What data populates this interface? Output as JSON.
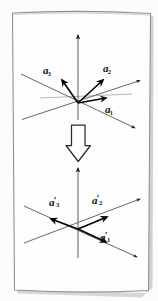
{
  "figure": {
    "kind": "scanned-book-figure",
    "caption_text": "",
    "background_color": "#fdfdfc",
    "ink_color": "#111111",
    "page_border_color": "#8a8a8a",
    "shadow_color": "#b9b9b9"
  },
  "panels": [
    {
      "id": "upper-axes-diagram",
      "name": "original-axes",
      "origin": {
        "x": 78,
        "y": 103
      },
      "vectors": [
        {
          "id": "a1",
          "label_a": "a",
          "label_sub": "1",
          "label_prime": "",
          "label_x": 105,
          "label_y": 107,
          "angle_deg": 12,
          "length": 30
        },
        {
          "id": "a2",
          "label_a": "a",
          "label_sub": "2",
          "label_prime": "",
          "label_x": 101,
          "label_y": 67,
          "angle_deg": 312,
          "length": 34
        },
        {
          "id": "a3",
          "label_a": "a",
          "label_sub": "3",
          "label_prime": "",
          "label_x": 44,
          "label_y": 70,
          "angle_deg": 238,
          "length": 28
        }
      ],
      "axis_lines": 3,
      "vertical_axis": true
    },
    {
      "id": "lower-axes-diagram",
      "name": "transformed-axes",
      "origin": {
        "x": 78,
        "y": 229
      },
      "vectors": [
        {
          "id": "a1p",
          "label_a": "a",
          "label_sub": "1",
          "label_prime": "′",
          "label_x": 101,
          "label_y": 235,
          "angle_deg": 26,
          "length": 31
        },
        {
          "id": "a2p",
          "label_a": "a",
          "label_sub": "2",
          "label_prime": "′",
          "label_x": 93,
          "label_y": 198,
          "angle_deg": 333,
          "length": 33
        },
        {
          "id": "a3p",
          "label_a": "a",
          "label_sub": "3",
          "label_prime": "′",
          "label_x": 50,
          "label_y": 200,
          "angle_deg": 194,
          "length": 28
        }
      ],
      "axis_lines": 3,
      "vertical_axis": true
    }
  ],
  "connector": {
    "name": "transformation-arrow",
    "direction": "down",
    "style": "hollow-outline-block-arrow",
    "x": 78,
    "y_top": 124,
    "y_bottom": 160
  }
}
